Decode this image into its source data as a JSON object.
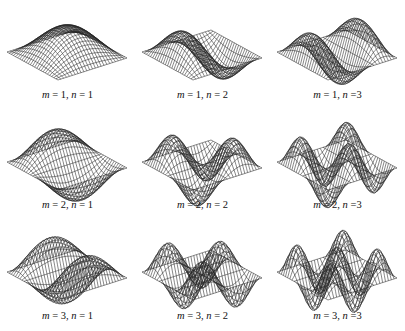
{
  "figure": {
    "type": "wireframe-surface-grid",
    "rows": 3,
    "cols": 3,
    "line_color": "#222222",
    "background": "#ffffff",
    "panels": [
      {
        "m": 1,
        "n": 1,
        "label_m": "m",
        "label_eq1": " = 1, ",
        "label_n": "n",
        "label_eq2": " = 1"
      },
      {
        "m": 1,
        "n": 2,
        "label_m": "m",
        "label_eq1": " = 1, ",
        "label_n": "n",
        "label_eq2": " = 2"
      },
      {
        "m": 1,
        "n": 3,
        "label_m": "m",
        "label_eq1": " = 1, ",
        "label_n": "n",
        "label_eq2": " =3"
      },
      {
        "m": 2,
        "n": 1,
        "label_m": "m",
        "label_eq1": " = 2, ",
        "label_n": "n",
        "label_eq2": " = 1"
      },
      {
        "m": 2,
        "n": 2,
        "label_m": "m",
        "label_eq1": " = 2, ",
        "label_n": "n",
        "label_eq2": " = 2"
      },
      {
        "m": 2,
        "n": 3,
        "label_m": "m",
        "label_eq1": " = 2, ",
        "label_n": "n",
        "label_eq2": " =3"
      },
      {
        "m": 3,
        "n": 1,
        "label_m": "m",
        "label_eq1": " = 3, ",
        "label_n": "n",
        "label_eq2": " = 1"
      },
      {
        "m": 3,
        "n": 2,
        "label_m": "m",
        "label_eq1": " = 3, ",
        "label_n": "n",
        "label_eq2": " = 2"
      },
      {
        "m": 3,
        "n": 3,
        "label_m": "m",
        "label_eq1": " = 3, ",
        "label_n": "n",
        "label_eq2": " =3"
      }
    ]
  }
}
